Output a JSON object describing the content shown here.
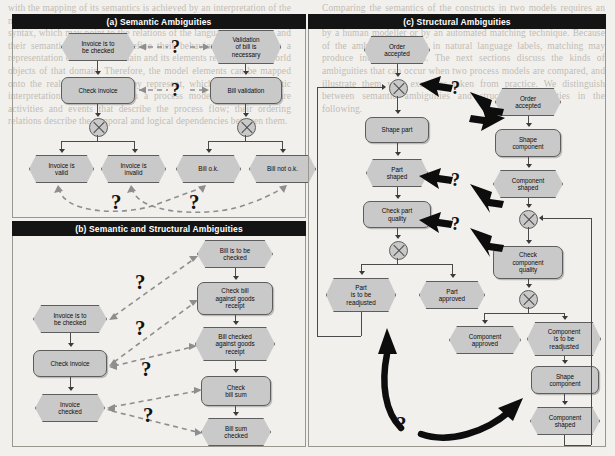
{
  "figure": {
    "panels": [
      {
        "id": "a",
        "title": "(a) Semantic Ambiguities"
      },
      {
        "id": "b",
        "title": "(b) Semantic and Structural Ambiguities"
      },
      {
        "id": "c",
        "title": "(c) Structural Ambiguities"
      }
    ],
    "question_mark": "?",
    "colors": {
      "node_fill": "#c9c9c9",
      "node_border": "#5d5d5d",
      "title_bar_bg": "#141414",
      "title_bar_text": "#ffffff",
      "dashed_link": "#8e8e8e",
      "solid_link": "#4a4a4a",
      "page_background": "#f2f0ec"
    }
  },
  "panel_a": {
    "nodes": [
      {
        "id": "a1",
        "type": "event",
        "label": "Invoice is to\nbe checked"
      },
      {
        "id": "a2",
        "type": "function",
        "label": "Check invoice"
      },
      {
        "id": "a3",
        "type": "connector",
        "label": "XOR"
      },
      {
        "id": "a4",
        "type": "event",
        "label": "Invoice is\nvalid"
      },
      {
        "id": "a5",
        "type": "event",
        "label": "Invoice is\ninvalid"
      },
      {
        "id": "a6",
        "type": "event",
        "label": "Validation\nof bill is\nnecessary"
      },
      {
        "id": "a7",
        "type": "function",
        "label": "Bill validation"
      },
      {
        "id": "a8",
        "type": "connector",
        "label": "XOR"
      },
      {
        "id": "a9",
        "type": "event",
        "label": "Bill o.k."
      },
      {
        "id": "a10",
        "type": "event",
        "label": "Bill not o.k."
      }
    ],
    "ambiguity_links": [
      {
        "from": "a1",
        "to": "a6",
        "marker": "?"
      },
      {
        "from": "a2",
        "to": "a7",
        "marker": "?"
      },
      {
        "from": "a4",
        "to": "a9",
        "marker": "?"
      },
      {
        "from": "a5",
        "to": "a10",
        "marker": "?"
      }
    ]
  },
  "panel_b": {
    "nodes": [
      {
        "id": "b1",
        "type": "event",
        "label": "Invoice is to\nbe checked"
      },
      {
        "id": "b2",
        "type": "function",
        "label": "Check invoice"
      },
      {
        "id": "b3",
        "type": "event",
        "label": "Invoice\nchecked"
      },
      {
        "id": "b4",
        "type": "event",
        "label": "Bill is to be\nchecked"
      },
      {
        "id": "b5",
        "type": "function",
        "label": "Check bill\nagainst goods\nreceipt"
      },
      {
        "id": "b6",
        "type": "event",
        "label": "Bill checked\nagainst goods\nreceipt"
      },
      {
        "id": "b7",
        "type": "function",
        "label": "Check\nbill sum"
      },
      {
        "id": "b8",
        "type": "event",
        "label": "Bill sum\nchecked"
      }
    ],
    "ambiguity_links": [
      {
        "from": "b1",
        "to": "b4",
        "marker": "?"
      },
      {
        "from": "b2",
        "to": "b5",
        "marker": "?"
      },
      {
        "from": "b2",
        "to": "b6",
        "marker": "?"
      },
      {
        "from": "b3",
        "to": "b7",
        "marker": "?"
      },
      {
        "from": "b3",
        "to": "b8",
        "marker": "?"
      }
    ]
  },
  "panel_c": {
    "left_nodes": [
      {
        "id": "c1",
        "type": "event",
        "label": "Order\naccepted"
      },
      {
        "id": "c2",
        "type": "connector",
        "label": "XOR"
      },
      {
        "id": "c3",
        "type": "function",
        "label": "Shape part"
      },
      {
        "id": "c4",
        "type": "event",
        "label": "Part\nshaped"
      },
      {
        "id": "c5",
        "type": "function",
        "label": "Check part\nquality"
      },
      {
        "id": "c6",
        "type": "connector",
        "label": "XOR"
      },
      {
        "id": "c7",
        "type": "event",
        "label": "Part\nis to be\nreadjusted"
      },
      {
        "id": "c8",
        "type": "event",
        "label": "Part\napproved"
      }
    ],
    "right_nodes": [
      {
        "id": "c9",
        "type": "event",
        "label": "Order\naccepted"
      },
      {
        "id": "c10",
        "type": "function",
        "label": "Shape\ncomponent"
      },
      {
        "id": "c11",
        "type": "event",
        "label": "Component\nshaped"
      },
      {
        "id": "c12",
        "type": "connector",
        "label": "XOR"
      },
      {
        "id": "c13",
        "type": "function",
        "label": "Check\ncomponent\nquality"
      },
      {
        "id": "c14",
        "type": "connector",
        "label": "XOR"
      },
      {
        "id": "c15",
        "type": "event",
        "label": "Component\napproved"
      },
      {
        "id": "c16",
        "type": "event",
        "label": "Component\nis to be\nreadjusted"
      },
      {
        "id": "c17",
        "type": "function",
        "label": "Shape\ncomponent"
      },
      {
        "id": "c18",
        "type": "event",
        "label": "Component\nshaped"
      }
    ],
    "ambiguity_links": [
      {
        "from": "c2",
        "to": "c9",
        "marker": "?",
        "style": "double-arrow"
      },
      {
        "from": "c4",
        "to": "c10",
        "marker": "?",
        "style": "double-arrow"
      },
      {
        "from": "c5",
        "to": "c12",
        "marker": "?",
        "style": "double-arrow"
      },
      {
        "from": "c7",
        "to": "c17",
        "marker": "?",
        "style": "curved-double-arrow"
      }
    ]
  },
  "background_text": {
    "left_column": "with the mapping of its semantics is achieved by an interpretation of the modelling language. The modelling language itself is described by its syntax, which may point to the relations of the language constructs, and their semantics, in order to define their behaviour. The model is a representation of a certain domain and its elements reflect the real world objects of that domain. Therefore, the model elements can be mapped onto the real world objects they represent, which allows a semantic interpretation of the model. In a process model, the elements are activities and events that describe the process flow; their ordering relations describe the temporal and logical dependencies between them.",
    "right_column": "Comparing the semantics of the constructs in two models requires an interpretation of the semantics of the elements of these models, either by a human modeller or by an automated matching technique. Because of the ambiguity inherent in natural language labels, matching may produce incorrect results. The next sections discuss the kinds of ambiguities that can occur when two process models are compared, and illustrate them with examples taken from practice. We distinguish between semantic ambiguities and structural ambiguities in the following."
  }
}
